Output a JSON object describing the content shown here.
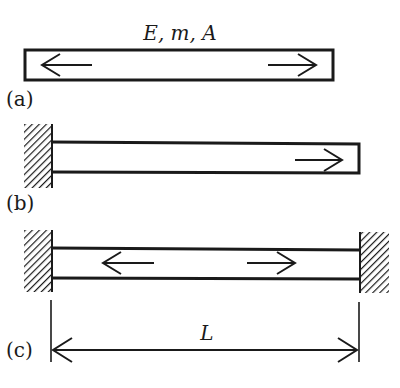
{
  "diagram": {
    "type": "axial bar boundary conditions",
    "properties_label": "E, m, A",
    "length_label": "L",
    "colors": {
      "ink": "#1a1a1a",
      "background": "#ffffff"
    },
    "panels": [
      {
        "id": "a",
        "label": "(a)",
        "description": "free-free bar",
        "supports": [],
        "arrows": [
          "left",
          "right"
        ]
      },
      {
        "id": "b",
        "label": "(b)",
        "description": "fixed-free bar",
        "supports": [
          "left-wall"
        ],
        "arrows": [
          "right"
        ]
      },
      {
        "id": "c",
        "label": "(c)",
        "description": "fixed-fixed bar",
        "supports": [
          "left-wall",
          "right-wall"
        ],
        "arrows": [
          "left",
          "right"
        ]
      }
    ]
  }
}
